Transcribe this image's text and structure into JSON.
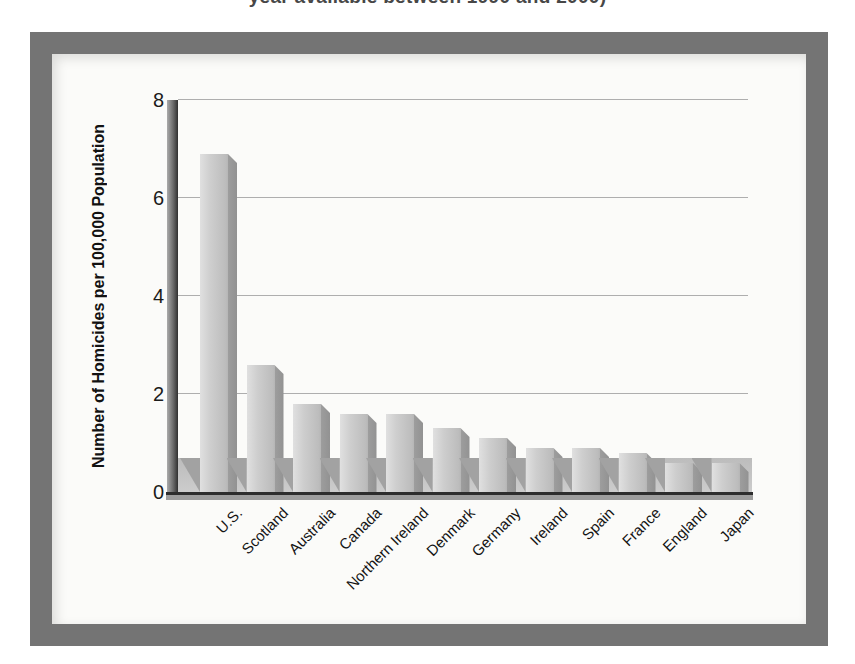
{
  "caption": {
    "visible_fragment": "year available between 1990 and 2000)"
  },
  "chart_data": {
    "type": "bar",
    "title": "year available between 1990 and 2000)",
    "categories": [
      "U.S.",
      "Scotland",
      "Australia",
      "Canada",
      "Northern Ireland",
      "Denmark",
      "Germany",
      "Ireland",
      "Spain",
      "France",
      "England",
      "Japan"
    ],
    "values": [
      6.9,
      2.6,
      1.8,
      1.6,
      1.6,
      1.3,
      1.1,
      0.9,
      0.9,
      0.8,
      0.6,
      0.6
    ],
    "xlabel": "",
    "ylabel": "Number of Homicides per 100,000 Population",
    "yticks": [
      0,
      2,
      4,
      6,
      8
    ],
    "ylim": [
      0,
      8
    ],
    "grid": true,
    "legend": false,
    "style_3d": true,
    "colors": {
      "frame": "#747474",
      "panel": "#fbfbf9",
      "bar_face": "#c4c4c4",
      "bar_side": "#969696",
      "floor": "#c6c6c6",
      "bar_shadow": "#a2a2a2",
      "gridline": "#aeaeae",
      "axis": "#2d2d2d",
      "text": "#1b1b1b"
    }
  }
}
